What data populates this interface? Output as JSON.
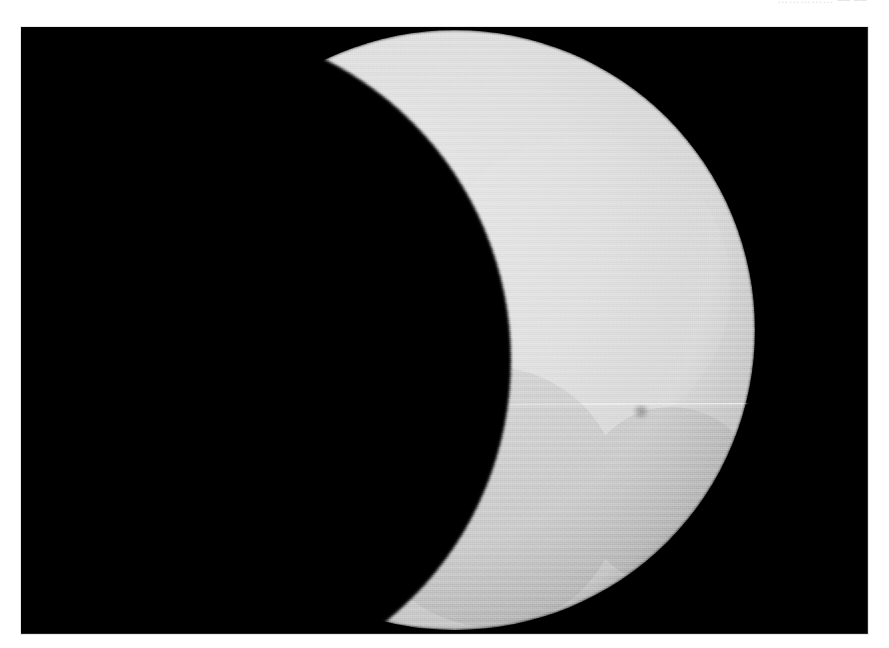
{
  "page": {
    "background_color": "#ffffff",
    "width": 889,
    "height": 648,
    "header_text_clipped": "……………  ––  ––"
  },
  "photo": {
    "title": "Partial Solar Eclipse",
    "caption": "",
    "frame": {
      "left": 21,
      "top": 27,
      "width": 847,
      "height": 607,
      "background_color": "#000000",
      "border_color": "#e9e9e9"
    },
    "subject": "partial solar eclipse — the lunar disk occulting roughly the left half of the solar photosphere",
    "sky_color": "#000000"
  },
  "chart_data": {
    "type": "scatter",
    "xlabel": "",
    "ylabel": "",
    "xlim": [
      0,
      847
    ],
    "ylim": [
      0,
      607
    ],
    "grid": false,
    "legend": "none",
    "series": [
      {
        "name": "solar-disk",
        "shape": "circle",
        "center_x": 434,
        "center_y": 303,
        "radius": 300,
        "fill": "#dcdcdc",
        "limb_darkening": true,
        "limb_edge_color": "#9a9a9a"
      },
      {
        "name": "lunar-disk",
        "shape": "circle",
        "center_x": 154,
        "center_y": 333,
        "radius": 336,
        "fill": "#000000",
        "occluding": true
      },
      {
        "name": "upper-cusp-tip",
        "shape": "point",
        "x": 184,
        "y": 106
      },
      {
        "name": "lower-cusp-tip",
        "shape": "point",
        "x": 444,
        "y": 607
      },
      {
        "name": "scan-line-artifact",
        "shape": "line",
        "y": 378,
        "x_start": 210,
        "x_end": 700,
        "color": "#f2f2f2",
        "thickness": 1.4
      },
      {
        "name": "sunspot",
        "shape": "point",
        "x": 620,
        "y": 384,
        "radius": 7,
        "fill": "#9c9c9c"
      }
    ]
  },
  "colors": {
    "page_background": "#ffffff",
    "sky": "#000000",
    "photosphere_core": "#e2e2e2",
    "photosphere_mid": "#dadada",
    "photosphere_limb": "#a6a6a6",
    "moon_silhouette": "#000000",
    "sunspot": "#9c9c9c",
    "scan_line": "#f4f4f4",
    "header_text": "#c9c9cd"
  }
}
